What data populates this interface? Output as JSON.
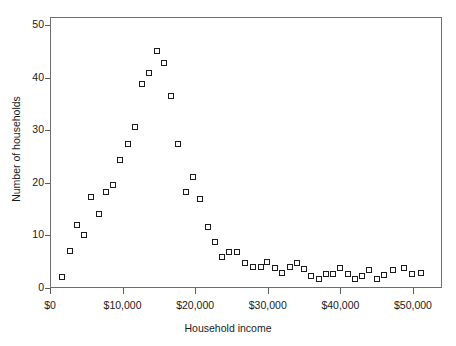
{
  "chart_data": {
    "type": "scatter",
    "title": "",
    "xlabel": "Household income",
    "ylabel": "Number of households",
    "xlim": [
      0,
      54000
    ],
    "ylim": [
      0,
      51.5
    ],
    "grid": false,
    "legend": null,
    "x_tick_values": [
      0,
      10000,
      20000,
      30000,
      40000,
      50000
    ],
    "x_tick_labels": [
      "$0",
      "$10,000",
      "$20,000",
      "$30,000",
      "$40,000",
      "$50,000"
    ],
    "y_tick_values": [
      0,
      10,
      20,
      30,
      40,
      50
    ],
    "y_tick_labels": [
      "0",
      "10",
      "20",
      "30",
      "40",
      "50"
    ],
    "marker": "open-square",
    "marker_color": "#1b1b1b",
    "points": [
      {
        "x": 1700,
        "y": 2.0
      },
      {
        "x": 2700,
        "y": 7.0
      },
      {
        "x": 3700,
        "y": 12.0
      },
      {
        "x": 4700,
        "y": 10.0
      },
      {
        "x": 5700,
        "y": 17.3
      },
      {
        "x": 6700,
        "y": 14.0
      },
      {
        "x": 7700,
        "y": 18.3
      },
      {
        "x": 8700,
        "y": 19.5
      },
      {
        "x": 9700,
        "y": 24.3
      },
      {
        "x": 10700,
        "y": 27.3
      },
      {
        "x": 11700,
        "y": 30.6
      },
      {
        "x": 12700,
        "y": 38.7
      },
      {
        "x": 13700,
        "y": 40.8
      },
      {
        "x": 14700,
        "y": 45.0
      },
      {
        "x": 15700,
        "y": 42.7
      },
      {
        "x": 16700,
        "y": 36.4
      },
      {
        "x": 17700,
        "y": 27.3
      },
      {
        "x": 18700,
        "y": 18.2
      },
      {
        "x": 19700,
        "y": 21.1
      },
      {
        "x": 20700,
        "y": 17.0
      },
      {
        "x": 21700,
        "y": 11.6
      },
      {
        "x": 22700,
        "y": 8.8
      },
      {
        "x": 23700,
        "y": 5.8
      },
      {
        "x": 24700,
        "y": 6.9
      },
      {
        "x": 25700,
        "y": 6.8
      },
      {
        "x": 26900,
        "y": 4.7
      },
      {
        "x": 28000,
        "y": 4.0
      },
      {
        "x": 29000,
        "y": 3.9
      },
      {
        "x": 29900,
        "y": 4.9
      },
      {
        "x": 31000,
        "y": 3.8
      },
      {
        "x": 32000,
        "y": 2.8
      },
      {
        "x": 33000,
        "y": 4.0
      },
      {
        "x": 34000,
        "y": 4.7
      },
      {
        "x": 35000,
        "y": 3.6
      },
      {
        "x": 36000,
        "y": 2.2
      },
      {
        "x": 37000,
        "y": 1.7
      },
      {
        "x": 38000,
        "y": 2.6
      },
      {
        "x": 39000,
        "y": 2.7
      },
      {
        "x": 40000,
        "y": 3.8
      },
      {
        "x": 41000,
        "y": 2.6
      },
      {
        "x": 42000,
        "y": 1.8
      },
      {
        "x": 43000,
        "y": 2.3
      },
      {
        "x": 44000,
        "y": 3.5
      },
      {
        "x": 45000,
        "y": 1.7
      },
      {
        "x": 46000,
        "y": 2.5
      },
      {
        "x": 47200,
        "y": 3.4
      },
      {
        "x": 48700,
        "y": 3.8
      },
      {
        "x": 49900,
        "y": 2.6
      },
      {
        "x": 51100,
        "y": 2.9
      }
    ]
  }
}
